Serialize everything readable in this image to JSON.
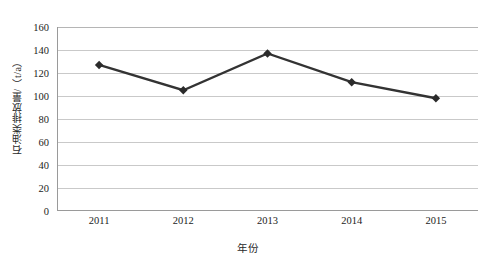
{
  "chart_data": {
    "type": "line",
    "title": "",
    "xlabel": "年份",
    "ylabel": "石油类排放量/（t/a）",
    "categories": [
      "2011",
      "2012",
      "2013",
      "2014",
      "2015"
    ],
    "values": [
      127,
      105,
      137,
      112,
      98
    ],
    "series": [
      {
        "name": "石油类排放量",
        "values": [
          127,
          105,
          137,
          112,
          98
        ]
      }
    ],
    "ylim": [
      0,
      160
    ],
    "ytick_step": 20,
    "yticks": [
      "160",
      "140",
      "120",
      "100",
      "80",
      "60",
      "40",
      "20",
      "0"
    ],
    "ytick_values": [
      160,
      140,
      120,
      100,
      80,
      60,
      40,
      20,
      0
    ],
    "grid": true,
    "legend": false,
    "legend_position": "none",
    "marker": "diamond",
    "line_color": "#333333",
    "marker_color": "#2b2b2b",
    "gridline_color": "#c9c9c9",
    "axis_color": "#9a9a9a",
    "background_color": "#ffffff"
  }
}
